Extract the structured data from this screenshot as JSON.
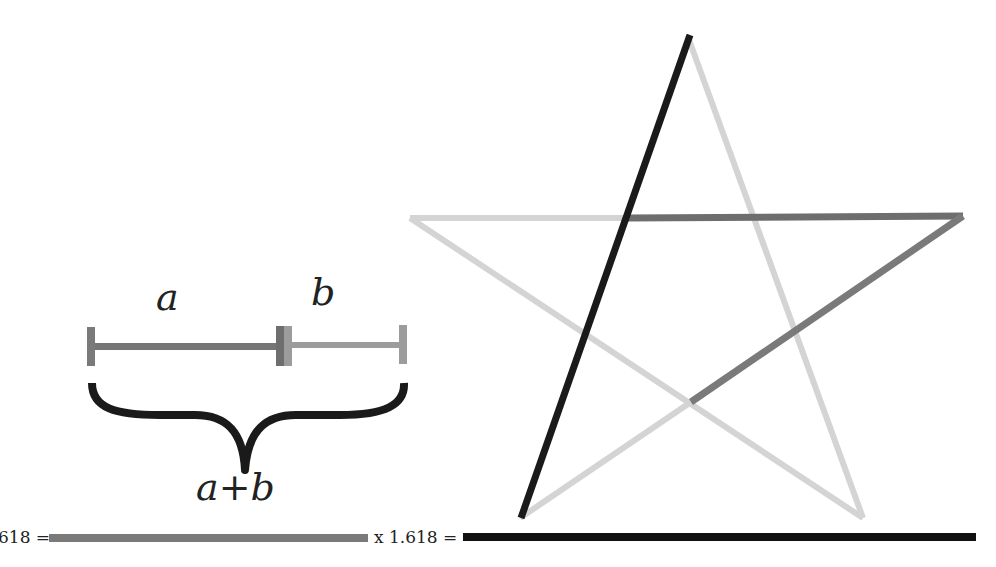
{
  "labels": {
    "a": "a",
    "b": "b",
    "sum": "a+b"
  },
  "equation": {
    "left_text": "618 =",
    "middle_text": "x 1.618 ="
  },
  "colors": {
    "black": "#1a1a1a",
    "dark_gray": "#6e6e6e",
    "mid_gray": "#7a7a7a",
    "light_gray": "#9c9c9c",
    "pale_gray": "#d4d4d4"
  },
  "star": {
    "vertices": {
      "top": [
        688,
        35
      ],
      "upper_left": [
        410,
        218
      ],
      "upper_right": [
        963,
        216
      ],
      "bottom_left": [
        520,
        518
      ],
      "bottom_right": [
        863,
        518
      ]
    }
  }
}
